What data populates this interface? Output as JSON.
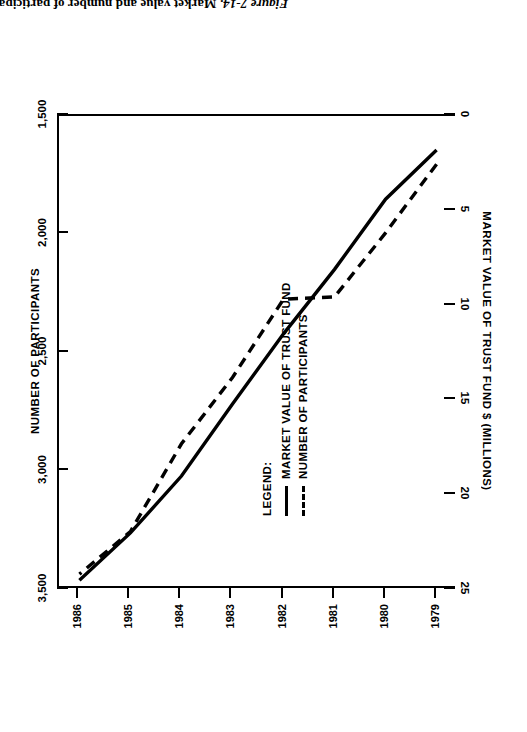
{
  "caption": {
    "figure_number": "Figure 7-14.",
    "text": "Market value and number of participants in investment plan trust fund."
  },
  "legend": {
    "heading": "LEGEND:",
    "entries": [
      {
        "label": "MARKET VALUE OF TRUST FUND",
        "style": "solid"
      },
      {
        "label": "NUMBER OF PARTICIPANTS",
        "style": "dashed"
      }
    ]
  },
  "axes": {
    "participants_title": "NUMBER OF PARTICIPANTS",
    "value_title": "MARKET VALUE OF TRUST FUND $ (MILLIONS)",
    "participants_ticks": [
      "3,500",
      "3,000",
      "2,500",
      "2,000",
      "1,500"
    ],
    "value_ticks": [
      "25",
      "20",
      "15",
      "10",
      "5",
      "0"
    ],
    "year_ticks": [
      "1979",
      "1980",
      "1981",
      "1982",
      "1983",
      "1984",
      "1985",
      "1986"
    ]
  },
  "chart_data": {
    "type": "line",
    "title": "Market value and number of participants in investment plan trust fund",
    "orientation": "rotated-90",
    "x": [
      1979,
      1980,
      1981,
      1982,
      1983,
      1984,
      1985,
      1986
    ],
    "xlabel": "",
    "series": [
      {
        "name": "MARKET VALUE OF TRUST FUND",
        "style": "solid",
        "axis": "market_value",
        "unit": "$ millions",
        "values": [
          2.0,
          4.6,
          8.3,
          11.7,
          15.4,
          19.2,
          22.2,
          24.7
        ]
      },
      {
        "name": "NUMBER OF PARTICIPANTS",
        "style": "dashed",
        "axis": "participants",
        "unit": "participants",
        "values": [
          1720,
          2010,
          2280,
          2290,
          2620,
          2900,
          3270,
          3450
        ]
      }
    ],
    "axis_market_value": {
      "label": "MARKET VALUE OF TRUST FUND $ (MILLIONS)",
      "ticks": [
        25,
        20,
        15,
        10,
        5,
        0
      ],
      "lim": [
        25,
        0
      ],
      "position": "bottom"
    },
    "axis_participants": {
      "label": "NUMBER OF PARTICIPANTS",
      "ticks": [
        3500,
        3000,
        2500,
        2000,
        1500
      ],
      "lim": [
        3500,
        1500
      ],
      "position": "top"
    },
    "axis_year": {
      "ticks": [
        1979,
        1980,
        1981,
        1982,
        1983,
        1984,
        1985,
        1986
      ],
      "lim": [
        1978.6,
        1986.4
      ],
      "position": "right"
    },
    "grid": false,
    "legend_position": "inside-left"
  }
}
